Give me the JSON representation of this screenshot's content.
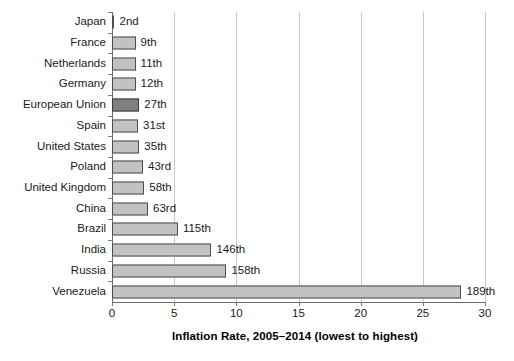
{
  "chart_data": {
    "type": "bar",
    "orientation": "horizontal",
    "title": "",
    "xlabel": "Inflation Rate, 2005–2014 (lowest to highest)",
    "ylabel": "",
    "xlim": [
      0,
      30
    ],
    "xticks": [
      0,
      5,
      10,
      15,
      20,
      25,
      30
    ],
    "xtick_labels": [
      "0",
      "5",
      "10",
      "15",
      "20",
      "25",
      "30"
    ],
    "grid": "vertical",
    "legend": "none",
    "categories": [
      "Japan",
      "France",
      "Netherlands",
      "Germany",
      "European Union",
      "Spain",
      "United States",
      "Poland",
      "United Kingdom",
      "China",
      "Brazil",
      "India",
      "Russia",
      "Venezuela"
    ],
    "values": [
      0.2,
      1.9,
      1.9,
      1.9,
      2.2,
      2.1,
      2.2,
      2.5,
      2.6,
      2.9,
      5.3,
      8.0,
      9.2,
      28.1
    ],
    "annotations": [
      "2nd",
      "9th",
      "11th",
      "12th",
      "27th",
      "31st",
      "35th",
      "43rd",
      "58th",
      "63rd",
      "115th",
      "146th",
      "158th",
      "189th"
    ],
    "highlight_category": "European Union",
    "colors": {
      "bar_fill": "#c2c2c2",
      "bar_border": "#4d4d4d",
      "highlight_fill": "#7f7f7f",
      "highlight_border": "#3a3a3a",
      "gridline": "#c8c8c8",
      "axis": "#6b6b6b",
      "text": "#1a1a1a",
      "background": "#ffffff"
    }
  }
}
